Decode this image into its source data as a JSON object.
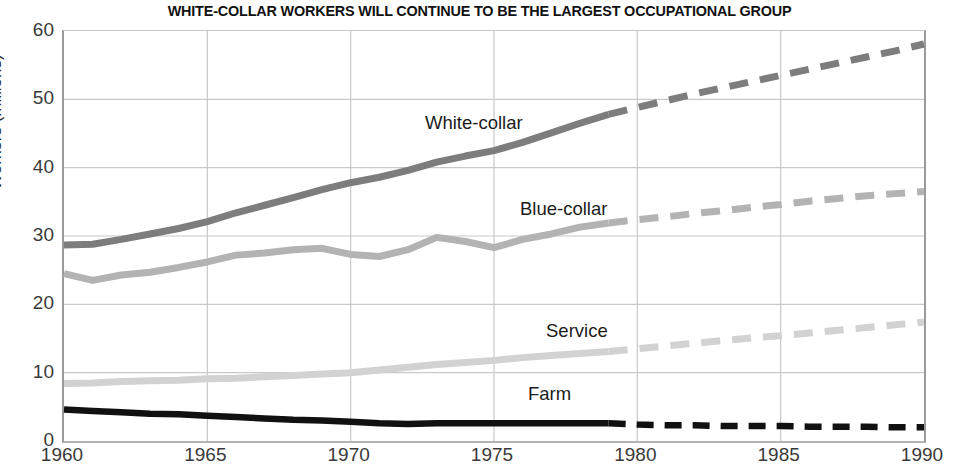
{
  "chart_data": {
    "type": "line",
    "title": "WHITE-COLLAR WORKERS WILL CONTINUE TO BE THE LARGEST OCCUPATIONAL GROUP",
    "xlabel": "",
    "ylabel": "Workers (millions)",
    "xlim": [
      1960,
      1990
    ],
    "ylim": [
      0,
      60
    ],
    "xticks": [
      "1960",
      "1965",
      "1970",
      "1975",
      "1980",
      "1985",
      "1990"
    ],
    "yticks": [
      "0",
      "10",
      "20",
      "30",
      "40",
      "50",
      "60"
    ],
    "grid": true,
    "legend_position": "inline-annotations",
    "projection_note": "Solid segments are historical through 1979; dashed segments are projections 1979-1990.",
    "series": [
      {
        "name": "White-collar",
        "color": "#7d7d7d",
        "label_x": 425,
        "label_y": 112,
        "x": [
          1960,
          1961,
          1962,
          1963,
          1964,
          1965,
          1966,
          1967,
          1968,
          1969,
          1970,
          1971,
          1972,
          1973,
          1974,
          1975,
          1976,
          1977,
          1978,
          1979,
          1980,
          1981,
          1982,
          1983,
          1984,
          1985,
          1986,
          1987,
          1988,
          1989,
          1990
        ],
        "values": [
          28.7,
          28.8,
          29.5,
          30.3,
          31.1,
          32.1,
          33.4,
          34.5,
          35.6,
          36.8,
          37.8,
          38.6,
          39.6,
          40.8,
          41.7,
          42.5,
          43.7,
          45.1,
          46.5,
          47.8,
          48.8,
          49.8,
          50.8,
          51.7,
          52.6,
          53.5,
          54.4,
          55.3,
          56.2,
          57.1,
          58.1
        ]
      },
      {
        "name": "Blue-collar",
        "color": "#b3b3b3",
        "label_x": 520,
        "label_y": 198,
        "x": [
          1960,
          1961,
          1962,
          1963,
          1964,
          1965,
          1966,
          1967,
          1968,
          1969,
          1970,
          1971,
          1972,
          1973,
          1974,
          1975,
          1976,
          1977,
          1978,
          1979,
          1980,
          1981,
          1982,
          1983,
          1984,
          1985,
          1986,
          1987,
          1988,
          1989,
          1990
        ],
        "values": [
          24.5,
          23.5,
          24.3,
          24.7,
          25.4,
          26.2,
          27.2,
          27.5,
          28.0,
          28.2,
          27.3,
          27.0,
          28.0,
          29.8,
          29.2,
          28.3,
          29.5,
          30.3,
          31.3,
          31.9,
          32.4,
          32.8,
          33.3,
          33.7,
          34.2,
          34.6,
          35.1,
          35.5,
          35.9,
          36.2,
          36.5
        ]
      },
      {
        "name": "Service",
        "color": "#d2d2d2",
        "label_x": 546,
        "label_y": 320,
        "x": [
          1960,
          1961,
          1962,
          1963,
          1964,
          1965,
          1966,
          1967,
          1968,
          1969,
          1970,
          1971,
          1972,
          1973,
          1974,
          1975,
          1976,
          1977,
          1978,
          1979,
          1980,
          1981,
          1982,
          1983,
          1984,
          1985,
          1986,
          1987,
          1988,
          1989,
          1990
        ],
        "values": [
          8.4,
          8.5,
          8.7,
          8.8,
          8.9,
          9.1,
          9.2,
          9.4,
          9.6,
          9.8,
          10.0,
          10.4,
          10.8,
          11.2,
          11.5,
          11.8,
          12.2,
          12.5,
          12.8,
          13.1,
          13.5,
          13.9,
          14.3,
          14.7,
          15.1,
          15.4,
          15.8,
          16.2,
          16.6,
          17.0,
          17.4
        ]
      },
      {
        "name": "Farm",
        "color": "#111111",
        "label_x": 528,
        "label_y": 383,
        "x": [
          1960,
          1961,
          1962,
          1963,
          1964,
          1965,
          1966,
          1967,
          1968,
          1969,
          1970,
          1971,
          1972,
          1973,
          1974,
          1975,
          1976,
          1977,
          1978,
          1979,
          1980,
          1981,
          1982,
          1983,
          1984,
          1985,
          1986,
          1987,
          1988,
          1989,
          1990
        ],
        "values": [
          4.6,
          4.4,
          4.2,
          4.0,
          3.9,
          3.7,
          3.5,
          3.3,
          3.1,
          3.0,
          2.8,
          2.6,
          2.5,
          2.6,
          2.6,
          2.6,
          2.6,
          2.6,
          2.6,
          2.6,
          2.4,
          2.3,
          2.3,
          2.2,
          2.2,
          2.2,
          2.1,
          2.1,
          2.1,
          2.0,
          2.0
        ]
      }
    ]
  }
}
